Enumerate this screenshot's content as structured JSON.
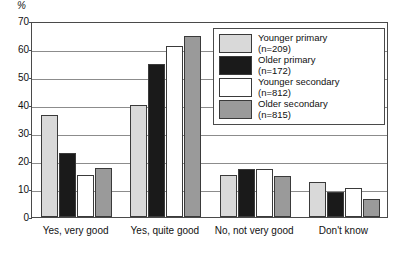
{
  "chart_data": {
    "type": "bar",
    "title": "",
    "xlabel": "",
    "ylabel": "%",
    "unit_label": "%",
    "ylim": [
      0,
      70
    ],
    "ytick_step": 10,
    "yticks": [
      0,
      10,
      20,
      30,
      40,
      50,
      60,
      70
    ],
    "grid": true,
    "legend_position": "top-right-inside",
    "categories": [
      "Yes, very good",
      "Yes, quite good",
      "No, not very good",
      "Don't know"
    ],
    "series": [
      {
        "name": "Younger primary",
        "n_label": "(n=209)",
        "n": 209,
        "color": "#d9d9d9",
        "values": [
          36.5,
          40.0,
          15.0,
          12.5
        ]
      },
      {
        "name": "Older primary",
        "n_label": "(n=172)",
        "n": 172,
        "color": "#1a1a1a",
        "values": [
          23.0,
          54.5,
          17.0,
          9.0
        ]
      },
      {
        "name": "Younger secondary",
        "n_label": "(n=812)",
        "n": 812,
        "color": "#ffffff",
        "values": [
          15.0,
          61.0,
          17.0,
          10.5
        ]
      },
      {
        "name": "Older secondary",
        "n_label": "(n=815)",
        "n": 815,
        "color": "#9a9a9a",
        "values": [
          17.5,
          64.5,
          14.5,
          6.5
        ]
      }
    ]
  },
  "colors": {
    "axis": "#4a4a4a",
    "gridline": "#8c8c8c",
    "bar_outline": "#3a3a3a",
    "text": "#111111",
    "background": "#ffffff"
  }
}
